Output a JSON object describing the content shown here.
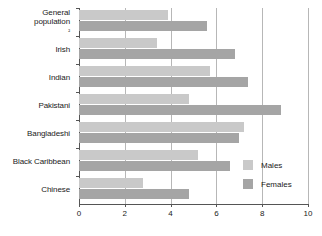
{
  "chart_data": {
    "type": "bar",
    "orientation": "horizontal",
    "title": "",
    "xlabel": "",
    "ylabel": "",
    "xlim": [
      0,
      10
    ],
    "xticks": [
      0,
      2,
      4,
      6,
      8,
      10
    ],
    "xtick_labels": [
      "0",
      "2",
      "4",
      "6",
      "8",
      "10"
    ],
    "grid": true,
    "grid_axis": "x",
    "legend_position": "right-inside",
    "categories": [
      "General population ²",
      "Irish",
      "Indian",
      "Pakistani",
      "Bangladeshi",
      "Black Caribbean",
      "Chinese"
    ],
    "category_lines": [
      [
        "General",
        "population ²"
      ],
      [
        "Irish"
      ],
      [
        "Indian"
      ],
      [
        "Pakistani"
      ],
      [
        "Bangladeshi"
      ],
      [
        "Black Caribbean"
      ],
      [
        "Chinese"
      ]
    ],
    "series": [
      {
        "name": "Males",
        "color": "#c9c9c9",
        "values": [
          3.9,
          3.4,
          5.7,
          4.8,
          7.2,
          5.2,
          2.8
        ]
      },
      {
        "name": "Females",
        "color": "#a5a5a5",
        "values": [
          5.6,
          6.8,
          7.4,
          8.8,
          7.0,
          6.6,
          4.8
        ]
      }
    ]
  },
  "legend": {
    "items": [
      {
        "label": "Males",
        "color": "#c9c9c9"
      },
      {
        "label": "Females",
        "color": "#a5a5a5"
      }
    ]
  },
  "colors": {
    "males": "#c9c9c9",
    "females": "#a5a5a5",
    "axis": "#555555",
    "gridline": "#b7b7b7",
    "background": "#ffffff",
    "text": "#1a1a1a"
  }
}
